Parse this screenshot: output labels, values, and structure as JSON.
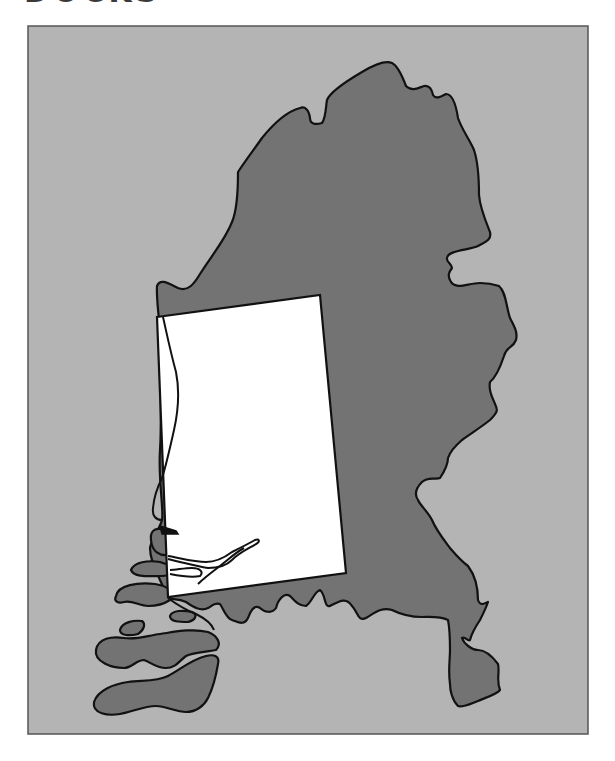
{
  "figure": {
    "title_clipped": "DOCKS",
    "title_note": "Only the bottom edge of a heading is visible at the top of the image",
    "frame": {
      "x": 28,
      "y": 26,
      "width": 560,
      "height": 708
    }
  },
  "map": {
    "subject": "Netherlands outline with a highlighted study-area rectangle",
    "colors": {
      "sea": "#b4b4b4",
      "land": "#737373",
      "outline": "#111111",
      "study_area": "#ffffff",
      "frame_border": "#555555"
    },
    "study_area": {
      "shape": "rotated rectangle",
      "corners": [
        [
          157,
          317
        ],
        [
          320,
          295
        ],
        [
          346,
          573
        ],
        [
          168,
          597
        ]
      ]
    },
    "layers": [
      {
        "name": "sea-background",
        "fill": "sea"
      },
      {
        "name": "mainland",
        "fill": "land"
      },
      {
        "name": "zeeland-islands",
        "fill": "land"
      },
      {
        "name": "study-area-rectangle",
        "fill": "study_area"
      },
      {
        "name": "coastline-inside-study-area",
        "stroke": "outline"
      },
      {
        "name": "rivers-inside-study-area",
        "stroke": "outline"
      }
    ]
  }
}
